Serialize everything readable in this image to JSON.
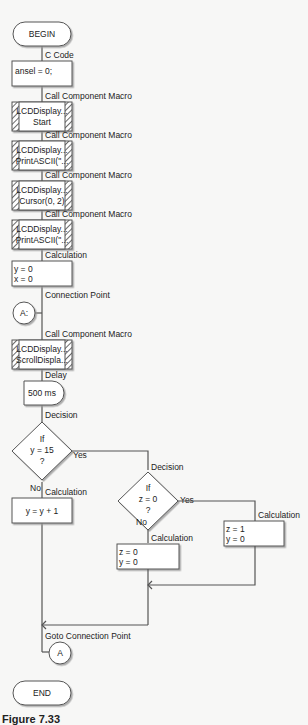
{
  "flowchart": {
    "begin": "BEGIN",
    "end": "END",
    "steps": [
      {
        "type": "C Code",
        "lines": [
          "ansel = 0;"
        ]
      },
      {
        "type": "Call Component Macro",
        "lines": [
          "LCDDisplay...",
          "Start"
        ]
      },
      {
        "type": "Call Component Macro",
        "lines": [
          "LCDDisplay...",
          "PrintASCII(\"..."
        ]
      },
      {
        "type": "Call Component Macro",
        "lines": [
          "LCDDisplay...",
          "Cursor(0, 2)"
        ]
      },
      {
        "type": "Call Component Macro",
        "lines": [
          "LCDDisplay...",
          "PrintASCII(\"..."
        ]
      },
      {
        "type": "Calculation",
        "lines": [
          "y = 0",
          "x = 0"
        ]
      },
      {
        "type": "Connection Point",
        "lines": [
          "A:"
        ]
      },
      {
        "type": "Call Component Macro",
        "lines": [
          "LCDDisplay...",
          "ScrollDispla..."
        ]
      },
      {
        "type": "Delay",
        "lines": [
          "500 ms"
        ]
      }
    ],
    "decision1": {
      "type": "Decision",
      "lines": [
        "If",
        "y = 15",
        "?"
      ],
      "yes": "Yes",
      "no": "No"
    },
    "calc_no1": {
      "type": "Calculation",
      "lines": [
        "y = y + 1"
      ]
    },
    "decision2": {
      "type": "Decision",
      "lines": [
        "If",
        "z = 0",
        "?"
      ],
      "yes": "Yes",
      "no": "No"
    },
    "calc_no2": {
      "type": "Calculation",
      "lines": [
        "z = 0",
        "y = 0"
      ]
    },
    "calc_yes2": {
      "type": "Calculation",
      "lines": [
        "z = 1",
        "y = 0"
      ]
    },
    "goto": {
      "type": "Goto Connection Point",
      "label": "A"
    }
  },
  "caption": "Figure 7.33"
}
